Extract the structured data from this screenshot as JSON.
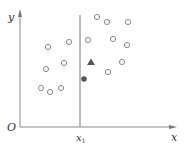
{
  "diagram": {
    "labels": {
      "origin": "O",
      "y_axis": "y",
      "x_axis": "x",
      "split_var": "x",
      "split_sub": "1"
    },
    "colors": {
      "axis": "#888888",
      "split_line": "#777777",
      "hollow_stroke": "#8a8a8a",
      "triangle": "#555555",
      "dot": "#555555",
      "text": "#333333"
    },
    "split_line_x": 80,
    "hollow_points": [
      [
        48,
        47
      ],
      [
        69,
        42
      ],
      [
        46,
        69
      ],
      [
        64,
        63
      ],
      [
        41,
        88
      ],
      [
        50,
        92
      ],
      [
        61,
        88
      ],
      [
        97,
        17
      ],
      [
        107,
        22
      ],
      [
        128,
        22
      ],
      [
        88,
        40
      ],
      [
        113,
        39
      ],
      [
        127,
        45
      ],
      [
        122,
        62
      ],
      [
        108,
        72
      ]
    ],
    "triangle_point": [
      91,
      62
    ],
    "filled_point": [
      84,
      79
    ]
  }
}
